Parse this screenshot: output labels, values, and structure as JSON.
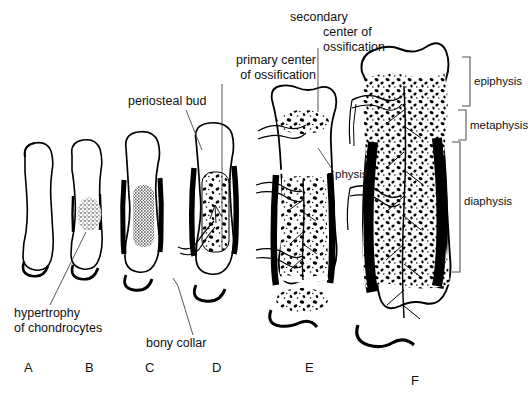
{
  "figure": {
    "ink_color": "#000000",
    "background_color": "#ffffff"
  },
  "labels": {
    "hypertrophy": "hypertrophy\nof chondrocytes",
    "periosteal_bud": "periosteal bud",
    "bony_collar": "bony collar",
    "primary_center": "primary center\nof ossification",
    "secondary_center_line1": "secondary",
    "secondary_center_rest": "center of\nossification",
    "physis": "physis",
    "epiphysis": "epiphysis",
    "metaphysis": "metaphysis",
    "diaphysis": "diaphysis"
  },
  "stages": [
    {
      "letter": "A",
      "name": "cartilage-model",
      "x": 24,
      "y": 360
    },
    {
      "letter": "B",
      "name": "chondrocyte-hypertrophy",
      "x": 85,
      "y": 360
    },
    {
      "letter": "C",
      "name": "bony-collar",
      "x": 145,
      "y": 360
    },
    {
      "letter": "D",
      "name": "primary-ossification",
      "x": 212,
      "y": 360
    },
    {
      "letter": "E",
      "name": "secondary-ossification",
      "x": 305,
      "y": 360
    },
    {
      "letter": "F",
      "name": "mature-bone",
      "x": 411,
      "y": 373
    }
  ],
  "brackets": [
    {
      "name": "epiphysis",
      "top": 57,
      "bottom": 106
    },
    {
      "name": "metaphysis",
      "top": 110,
      "bottom": 140
    },
    {
      "name": "diaphysis",
      "top": 142,
      "bottom": 272
    }
  ]
}
